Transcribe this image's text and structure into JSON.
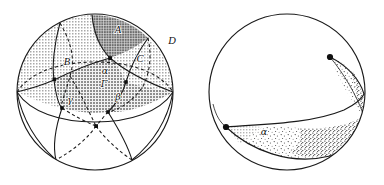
{
  "figure": {
    "panels": [
      {
        "id": "left",
        "name": "sphere-with-great-circles",
        "description": "Sphere subdivided by three great circles forming shaded spherical triangles",
        "labels": [
          {
            "id": "A",
            "text": "A",
            "x": 118,
            "y": 33,
            "kind": "region"
          },
          {
            "id": "B",
            "text": "B",
            "x": 67,
            "y": 65,
            "kind": "vertex"
          },
          {
            "id": "C",
            "text": "C",
            "x": 140,
            "y": 62,
            "kind": "vertex"
          },
          {
            "id": "D",
            "text": "D",
            "x": 172,
            "y": 44,
            "kind": "outside"
          },
          {
            "id": "alpha",
            "text": "α",
            "x": 105,
            "y": 74,
            "kind": "angle"
          },
          {
            "id": "gamma_mid",
            "text": "Γ",
            "x": 104,
            "y": 86,
            "kind": "region"
          },
          {
            "id": "gamma",
            "text": "γ",
            "x": 70,
            "y": 103,
            "kind": "angle"
          },
          {
            "id": "beta",
            "text": "β",
            "x": 118,
            "y": 100,
            "kind": "angle"
          }
        ],
        "sphere": {
          "cx": 95,
          "cy": 92,
          "r": 78
        },
        "colors": {
          "outline": "#1a1a1a",
          "shade_light": "#d6d6d6",
          "shade_mid": "#bdbdbd",
          "shade_dark": "#9e9e9e",
          "background": "#ffffff"
        }
      },
      {
        "id": "right",
        "name": "sphere-with-lune",
        "description": "Sphere containing a stippled spherical lune bounded by two great-circle arcs meeting at two antipodal vertices",
        "labels": [
          {
            "id": "alpha",
            "text": "α",
            "x": 264,
            "y": 131,
            "kind": "angle"
          }
        ],
        "sphere": {
          "cx": 287,
          "cy": 92,
          "r": 78
        },
        "colors": {
          "outline": "#1a1a1a",
          "stipple": "#2b2b2b",
          "shade_light": "#dcdcdc",
          "background": "#ffffff"
        }
      }
    ],
    "icons": [
      {
        "name": "vertex-dot-icon",
        "count": 8
      }
    ]
  }
}
